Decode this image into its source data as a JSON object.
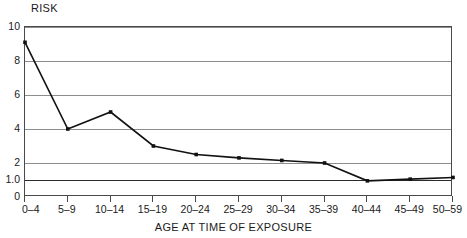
{
  "chart_data": {
    "type": "line",
    "title": "",
    "ylabel": "RISK",
    "xlabel": "AGE AT TIME OF EXPOSURE",
    "categories": [
      "0–4",
      "5–9",
      "10–14",
      "15–19",
      "20–24",
      "25–29",
      "30–34",
      "35–39",
      "40–44",
      "45–49",
      "50–59"
    ],
    "values": [
      9.1,
      4.0,
      5.0,
      3.0,
      2.5,
      2.3,
      2.15,
      2.0,
      0.95,
      1.05,
      1.15
    ],
    "series": [
      {
        "name": "Risk",
        "values": [
          9.1,
          4.0,
          5.0,
          3.0,
          2.5,
          2.3,
          2.15,
          2.0,
          0.95,
          1.05,
          1.15
        ]
      }
    ],
    "ylim": [
      0,
      10
    ],
    "yticks": [
      0,
      1.0,
      2,
      4,
      6,
      8,
      10
    ],
    "ytick_labels": [
      "0",
      "1.0",
      "2",
      "4",
      "6",
      "8",
      "10"
    ],
    "reference_line": 1.0,
    "grid": "horizontal",
    "legend": "none",
    "marker": "square",
    "line_color": "#111111",
    "grid_color": "#8d8d8d",
    "reference_color": "#2b2b2b"
  }
}
